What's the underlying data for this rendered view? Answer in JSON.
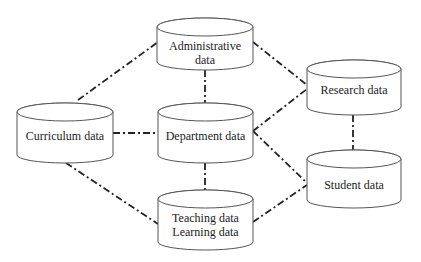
{
  "diagram": {
    "type": "database-relationship",
    "nodes": {
      "administrative": {
        "lines": [
          "Administrative",
          "data"
        ]
      },
      "curriculum": {
        "lines": [
          "Curriculum data"
        ]
      },
      "department": {
        "lines": [
          "Department data"
        ]
      },
      "teaching": {
        "lines": [
          "Teaching data",
          "Learning data"
        ]
      },
      "research": {
        "lines": [
          "Research data"
        ]
      },
      "student": {
        "lines": [
          "Student data"
        ]
      }
    },
    "edges": [
      [
        "curriculum",
        "administrative"
      ],
      [
        "curriculum",
        "department"
      ],
      [
        "curriculum",
        "teaching"
      ],
      [
        "administrative",
        "department"
      ],
      [
        "administrative",
        "research"
      ],
      [
        "department",
        "teaching"
      ],
      [
        "department",
        "research"
      ],
      [
        "department",
        "student"
      ],
      [
        "teaching",
        "student"
      ],
      [
        "research",
        "student"
      ]
    ],
    "line_style": "dash-dot",
    "colors": {
      "stroke": "#555555",
      "connector": "#222222",
      "text": "#222222",
      "background": "#ffffff"
    }
  }
}
